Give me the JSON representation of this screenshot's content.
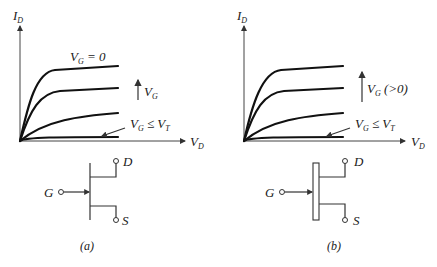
{
  "panels": [
    {
      "id": "a",
      "caption": "(a)",
      "y_axis": {
        "label": "I",
        "sub": "D"
      },
      "x_axis": {
        "label": "V",
        "sub": "D"
      },
      "top_curve_label": {
        "main": "V",
        "sub": "G",
        "rest": " = 0"
      },
      "arrow_label": {
        "main": "V",
        "sub": "G",
        "rest": ""
      },
      "threshold_label": {
        "main": "V",
        "sub": "G",
        "mid": " ≤ V",
        "sub2": "T"
      },
      "circuit": {
        "gate": "G",
        "drain": "D",
        "source": "S",
        "channel": "line"
      }
    },
    {
      "id": "b",
      "caption": "(b)",
      "y_axis": {
        "label": "I",
        "sub": "D"
      },
      "x_axis": {
        "label": "V",
        "sub": "D"
      },
      "top_curve_label": null,
      "arrow_label": {
        "main": "V",
        "sub": "G",
        "rest": " (>0)"
      },
      "threshold_label": {
        "main": "V",
        "sub": "G",
        "mid": " ≤ V",
        "sub2": "T"
      },
      "circuit": {
        "gate": "G",
        "drain": "D",
        "source": "S",
        "channel": "box"
      }
    }
  ],
  "colors": {
    "ink": "#111111",
    "background": "#ffffff"
  }
}
